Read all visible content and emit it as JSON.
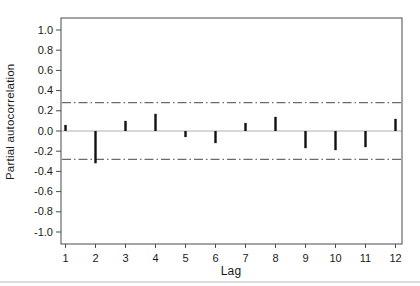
{
  "chart_data": {
    "type": "bar",
    "subtype": "stem-pacf",
    "title": "",
    "xlabel": "Lag",
    "ylabel": "Partial autocorrelation",
    "categories": [
      1,
      2,
      3,
      4,
      5,
      6,
      7,
      8,
      9,
      10,
      11,
      12
    ],
    "values": [
      0.06,
      -0.32,
      0.1,
      0.17,
      -0.06,
      -0.12,
      0.08,
      0.14,
      -0.17,
      -0.19,
      -0.16,
      0.12
    ],
    "confidence_bounds": {
      "upper": 0.28,
      "lower": -0.28,
      "line_style": "dash-dot"
    },
    "y_ticks": [
      1.0,
      0.8,
      0.6,
      0.4,
      0.2,
      0.0,
      -0.2,
      -0.4,
      -0.6,
      -0.8,
      -1.0
    ],
    "y_tick_labels": [
      "1.0",
      "0.8",
      "0.6",
      "0.4",
      "0.2",
      "0.0",
      "-0.2",
      "-0.4",
      "-0.6",
      "-0.8",
      "-1.0"
    ],
    "x_tick_labels": [
      "1",
      "2",
      "3",
      "4",
      "5",
      "6",
      "7",
      "8",
      "9",
      "10",
      "11",
      "12"
    ],
    "ylim": [
      -1.12,
      1.12
    ],
    "grid": false,
    "legend": false,
    "zero_line": true
  },
  "colors": {
    "bar": "#111111",
    "frame": "#4a4a4a",
    "zero_line": "#b0b0b0",
    "confidence_line": "#6b6b6b",
    "tick_text": "#1a1a1a",
    "background": "#ffffff"
  }
}
